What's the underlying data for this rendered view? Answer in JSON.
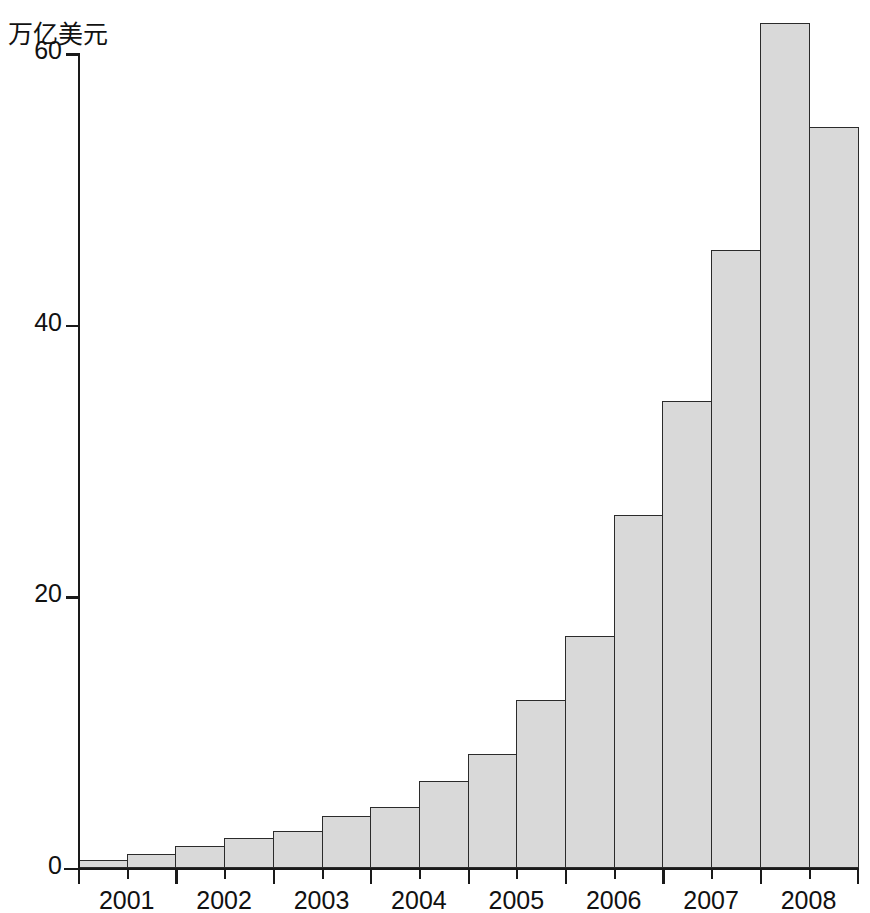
{
  "chart_data": {
    "type": "bar",
    "title": "",
    "subtitle": "",
    "xlabel": "",
    "ylabel": "万亿美元",
    "ylim": [
      0,
      64
    ],
    "xlim": [
      0,
      16
    ],
    "grid": false,
    "legend": null,
    "y_ticks": [
      {
        "value": 0,
        "label": "0"
      },
      {
        "value": 20,
        "label": "20"
      },
      {
        "value": 40,
        "label": "40"
      },
      {
        "value": 60,
        "label": "60"
      }
    ],
    "x_ticks": [
      {
        "label": "2001",
        "index": 0
      },
      {
        "label": "2002",
        "index": 2
      },
      {
        "label": "2003",
        "index": 4
      },
      {
        "label": "2004",
        "index": 6
      },
      {
        "label": "2005",
        "index": 8
      },
      {
        "label": "2006",
        "index": 10
      },
      {
        "label": "2007",
        "index": 12
      },
      {
        "label": "2008",
        "index": 14
      }
    ],
    "categories": [
      "2001 H1",
      "2001 H2",
      "2002 H1",
      "2002 H2",
      "2003 H1",
      "2003 H2",
      "2004 H1",
      "2004 H2",
      "2005 H1",
      "2005 H2",
      "2006 H1",
      "2006 H2",
      "2007 H1",
      "2007 H2",
      "2008 H1",
      "2008 H2"
    ],
    "values": [
      0.6,
      1.0,
      1.6,
      2.2,
      2.7,
      3.8,
      4.5,
      6.4,
      8.4,
      12.4,
      17.1,
      26.0,
      34.4,
      45.5,
      62.2,
      54.6
    ],
    "bar_color": "#d9d9d9",
    "bar_edge_color": "#2b2b2b",
    "axis_color": "#1a1a1a"
  }
}
